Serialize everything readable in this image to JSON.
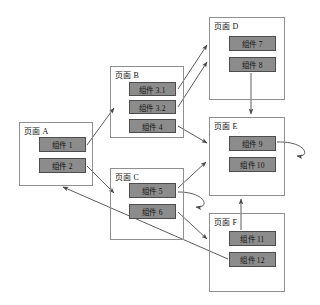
{
  "diagram": {
    "canvas": {
      "width": 320,
      "height": 305
    },
    "style": {
      "page_border_color": "#8f8f8f",
      "component_fill": "#8c8c8c",
      "component_border": "#4d4d4d",
      "arrow_color": "#4a4a4a",
      "text_color": "#141414",
      "background": "#ffffff"
    },
    "pages": [
      {
        "id": "A",
        "label": "页面 A",
        "x": 19,
        "y": 122,
        "w": 74,
        "h": 64,
        "components": [
          {
            "id": "c1",
            "label": "组件 1",
            "x": 39,
            "y": 137,
            "w": 47,
            "h": 15
          },
          {
            "id": "c2",
            "label": "组件 2",
            "x": 39,
            "y": 158,
            "w": 47,
            "h": 15
          }
        ]
      },
      {
        "id": "B",
        "label": "页面 B",
        "x": 110,
        "y": 66,
        "w": 74,
        "h": 72,
        "components": [
          {
            "id": "c31",
            "label": "组件 3.1",
            "x": 129,
            "y": 82,
            "w": 47,
            "h": 14
          },
          {
            "id": "c32",
            "label": "组件 3.2",
            "x": 129,
            "y": 100,
            "w": 47,
            "h": 14
          },
          {
            "id": "c4",
            "label": "组件 4",
            "x": 129,
            "y": 119,
            "w": 47,
            "h": 14
          }
        ]
      },
      {
        "id": "C",
        "label": "页面 C",
        "x": 110,
        "y": 168,
        "w": 74,
        "h": 72,
        "components": [
          {
            "id": "c5",
            "label": "组件 5",
            "x": 129,
            "y": 183,
            "w": 47,
            "h": 15
          },
          {
            "id": "c6",
            "label": "组件 6",
            "x": 129,
            "y": 204,
            "w": 47,
            "h": 15
          }
        ]
      },
      {
        "id": "D",
        "label": "页面 D",
        "x": 209,
        "y": 17,
        "w": 76,
        "h": 83,
        "components": [
          {
            "id": "c7",
            "label": "组件 7",
            "x": 229,
            "y": 36,
            "w": 47,
            "h": 15
          },
          {
            "id": "c8",
            "label": "组件 8",
            "x": 229,
            "y": 57,
            "w": 47,
            "h": 15
          }
        ]
      },
      {
        "id": "E",
        "label": "页面 E",
        "x": 209,
        "y": 117,
        "w": 76,
        "h": 79,
        "components": [
          {
            "id": "c9",
            "label": "组件 9",
            "x": 229,
            "y": 136,
            "w": 47,
            "h": 15
          },
          {
            "id": "c10",
            "label": "组件 10",
            "x": 229,
            "y": 157,
            "w": 47,
            "h": 15
          }
        ]
      },
      {
        "id": "F",
        "label": "页面 F",
        "x": 209,
        "y": 213,
        "w": 76,
        "h": 79,
        "components": [
          {
            "id": "c11",
            "label": "组件 11",
            "x": 229,
            "y": 231,
            "w": 47,
            "h": 15
          },
          {
            "id": "c12",
            "label": "组件 12",
            "x": 229,
            "y": 252,
            "w": 47,
            "h": 15
          }
        ]
      }
    ],
    "connections": [
      {
        "name": "component-1-to-page-b",
        "from": "c1",
        "to": "B",
        "path": "M 87 145 L 114 108",
        "arrow": "end"
      },
      {
        "name": "component-2-to-page-c",
        "from": "c2",
        "to": "C",
        "path": "M 87 166 L 114 193",
        "arrow": "end"
      },
      {
        "name": "component-3-1-to-page-d",
        "from": "c31",
        "to": "D",
        "path": "M 178 89 L 207 45",
        "arrow": "end"
      },
      {
        "name": "component-3-2-to-page-d",
        "from": "c32",
        "to": "D",
        "path": "M 178 107 L 207 62",
        "arrow": "end"
      },
      {
        "name": "component-4-to-page-e",
        "from": "c4",
        "to": "E",
        "path": "M 178 126 L 207 143",
        "arrow": "end"
      },
      {
        "name": "component-8-to-page-e",
        "from": "c8",
        "to": "E",
        "path": "M 251 73 L 251 114",
        "arrow": "end"
      },
      {
        "name": "component-5-to-page-e",
        "from": "c5",
        "to": "E",
        "path": "M 178 188 L 206 162",
        "arrow": "end"
      },
      {
        "name": "component-5-self-loop",
        "from": "c5",
        "to": "c5",
        "path": "M 178 192 C 207 192 210 209 196 207",
        "arrow": "end"
      },
      {
        "name": "component-6-to-page-f",
        "from": "c6",
        "to": "F",
        "path": "M 178 212 L 207 239",
        "arrow": "end"
      },
      {
        "name": "component-9-self-loop",
        "from": "c9",
        "to": "c9",
        "path": "M 277 142 C 307 141 311 158 297 156",
        "arrow": "end"
      },
      {
        "name": "component-11-to-page-e",
        "from": "c11",
        "to": "E",
        "path": "M 241 230 L 241 199",
        "arrow": "end"
      },
      {
        "name": "component-12-to-page-a",
        "from": "c12",
        "to": "A",
        "path": "M 228 259 L 63 187",
        "arrow": "end"
      }
    ]
  }
}
